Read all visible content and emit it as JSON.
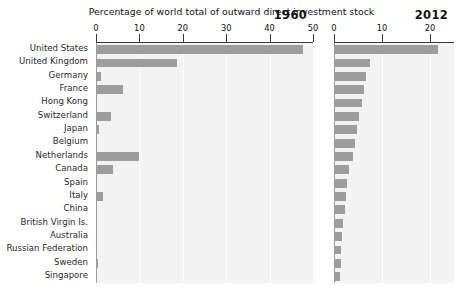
{
  "chart_data": {
    "type": "bar",
    "title": "Percentage of world total of outward direct investment stock",
    "xlabel": "",
    "ylabel": "",
    "orientation": "horizontal",
    "grid": true,
    "legend": false,
    "categories": [
      "United States",
      "United Kingdom",
      "Germany",
      "France",
      "Hong Kong",
      "Switzerland",
      "Japan",
      "Belgium",
      "Netherlands",
      "Canada",
      "Spain",
      "Italy",
      "China",
      "British Virgin Is.",
      "Australia",
      "Russian Federation",
      "Sweden",
      "Singapore"
    ],
    "panels": [
      {
        "name": "1960",
        "year_label": "1960",
        "xlim": [
          0,
          50
        ],
        "xticks": [
          0,
          10,
          20,
          30,
          40,
          50
        ],
        "xticklabels": [
          "0",
          "10",
          "20",
          "30",
          "40",
          "50"
        ],
        "values": [
          47.8,
          18.6,
          1.1,
          6.2,
          0.0,
          3.5,
          0.6,
          0.0,
          9.9,
          3.9,
          0.0,
          1.6,
          0.0,
          0.0,
          0.0,
          0.0,
          0.4,
          0.0
        ]
      },
      {
        "name": "2012",
        "year_label": "2012",
        "xlim": [
          0,
          25
        ],
        "xticks": [
          0,
          10,
          20
        ],
        "xticklabels": [
          "0",
          "10",
          "20"
        ],
        "values": [
          21.7,
          7.6,
          6.7,
          6.2,
          5.8,
          5.2,
          4.8,
          4.3,
          4.0,
          3.2,
          2.7,
          2.4,
          2.2,
          1.9,
          1.6,
          1.5,
          1.4,
          1.2
        ]
      }
    ]
  },
  "colors": {
    "bar": "#9d9d9d",
    "plot_background": "#f3f3f3",
    "gridline": "#ffffff",
    "axis": "#3a3a3a",
    "text": "#111111"
  }
}
